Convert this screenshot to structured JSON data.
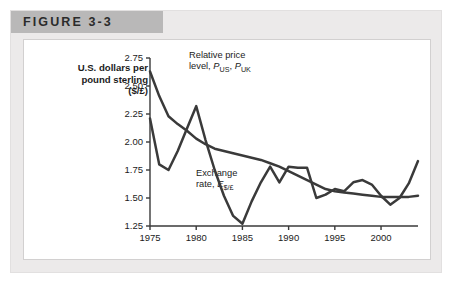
{
  "figure": {
    "label": "FIGURE 3-3",
    "band_color": "#b9b8b8",
    "panel_color": "#eceaea"
  },
  "axis_title": {
    "line1": "U.S. dollars per",
    "line2": "pound sterling",
    "line3": "($/£)"
  },
  "annotations": {
    "relative_price": {
      "line1": "Relative price",
      "line2_prefix": "level, ",
      "symbol1": "P",
      "sub1": "US",
      "separator": ", ",
      "symbol2": "P",
      "sub2": "UK"
    },
    "exchange_rate": {
      "line1": "Exchange",
      "line2_prefix": "rate, ",
      "symbol1": "E",
      "sub1": "$/£"
    }
  },
  "chart_data": {
    "type": "line",
    "title": "FIGURE 3-3",
    "xlabel": "",
    "ylabel": "U.S. dollars per pound sterling ($/£)",
    "xlim": [
      1975,
      2004
    ],
    "ylim": [
      1.25,
      2.75
    ],
    "ytick_values": [
      1.25,
      1.5,
      1.75,
      2.0,
      2.25,
      2.5,
      2.75
    ],
    "ytick_labels": [
      "1.25",
      "1.50",
      "1.75",
      "2.00",
      "2.25",
      "2.50",
      "2.75"
    ],
    "xtick_values": [
      1975,
      1980,
      1985,
      1990,
      1995,
      2000
    ],
    "xtick_labels": [
      "1975",
      "1980",
      "1985",
      "1990",
      "1995",
      "2000"
    ],
    "grid": false,
    "legend": "annotations-inline",
    "line_color": "#3a3a3a",
    "line_width": 2.5,
    "x": [
      1975,
      1976,
      1977,
      1978,
      1979,
      1980,
      1981,
      1982,
      1983,
      1984,
      1985,
      1986,
      1987,
      1988,
      1989,
      1990,
      1991,
      1992,
      1993,
      1994,
      1995,
      1996,
      1997,
      1998,
      1999,
      2000,
      2001,
      2002,
      2003,
      2004
    ],
    "series": [
      {
        "name": "Relative price level, P_US, P_UK",
        "values": [
          2.63,
          2.41,
          2.23,
          2.16,
          2.1,
          2.03,
          1.98,
          1.94,
          1.92,
          1.9,
          1.88,
          1.86,
          1.84,
          1.81,
          1.78,
          1.74,
          1.7,
          1.66,
          1.62,
          1.58,
          1.56,
          1.55,
          1.54,
          1.53,
          1.52,
          1.51,
          1.51,
          1.51,
          1.51,
          1.52
        ]
      },
      {
        "name": "Exchange rate, E_$/£",
        "values": [
          2.21,
          1.8,
          1.75,
          1.92,
          2.12,
          2.32,
          2.02,
          1.75,
          1.52,
          1.34,
          1.27,
          1.47,
          1.64,
          1.78,
          1.64,
          1.78,
          1.77,
          1.77,
          1.5,
          1.53,
          1.58,
          1.56,
          1.64,
          1.66,
          1.62,
          1.52,
          1.44,
          1.5,
          1.63,
          1.83
        ]
      }
    ]
  }
}
